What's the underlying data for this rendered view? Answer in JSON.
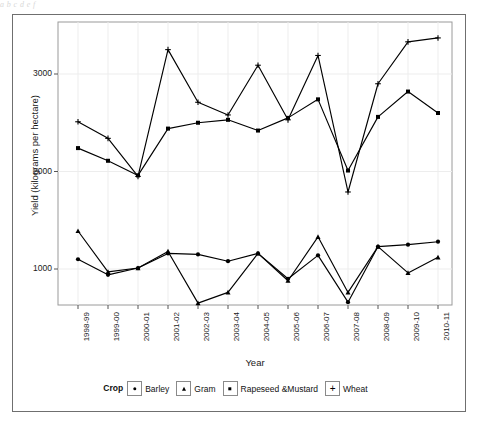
{
  "top_cut_text": "a   b          c  d        e         f",
  "chart_data": {
    "type": "line",
    "title": "",
    "subtitle": "",
    "xlabel": "Year",
    "ylabel": "Yield (kilograms per hectare)",
    "categories": [
      "1998-99",
      "1999-00",
      "2000-01",
      "2001-02",
      "2002-03",
      "2003-04",
      "2004-05",
      "2005-06",
      "2006-07",
      "2007-08",
      "2008-09",
      "2009-10",
      "2010-11"
    ],
    "ylim": [
      450,
      3450
    ],
    "yticks": [
      1000,
      2000,
      3000
    ],
    "ytick_labels": [
      "1000",
      "2000",
      "3000"
    ],
    "grid": true,
    "grid_axis": "both",
    "legend_title": "Crop",
    "legend_position": "bottom",
    "series": [
      {
        "name": "Barley",
        "marker": "circle",
        "marker_glyph": "circle",
        "values": [
          1100,
          940,
          1010,
          1160,
          1150,
          1080,
          1160,
          900,
          1140,
          660,
          1230,
          1250,
          1280
        ]
      },
      {
        "name": "Gram",
        "marker": "triangle",
        "marker_glyph": "triangle",
        "values": [
          1390,
          970,
          1010,
          1180,
          650,
          760,
          1160,
          880,
          1330,
          760,
          1230,
          960,
          1120
        ]
      },
      {
        "name": "Rapeseed &Mustard",
        "marker": "square",
        "marker_glyph": "square",
        "values": [
          2240,
          2110,
          1960,
          2440,
          2500,
          2530,
          2420,
          2550,
          2740,
          2010,
          2560,
          2820,
          2600
        ]
      },
      {
        "name": "Wheat",
        "marker": "plus",
        "marker_glyph": "plus",
        "values": [
          2510,
          2340,
          1950,
          3250,
          2710,
          2580,
          3090,
          2530,
          3190,
          1790,
          2900,
          3330,
          3370
        ]
      }
    ]
  }
}
